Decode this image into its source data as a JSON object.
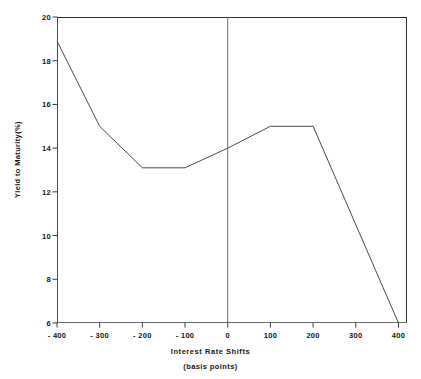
{
  "chart_data": {
    "type": "line",
    "title": "",
    "xlabel": "Interest Rate Shifts",
    "xlabel_line2": "(basis points)",
    "ylabel": "Yield to Maturity(%)",
    "xlim": [
      -400,
      420
    ],
    "ylim": [
      6,
      20
    ],
    "grid": false,
    "legend": null,
    "xticks": [
      -400,
      -300,
      -200,
      -100,
      0,
      100,
      200,
      300,
      400
    ],
    "xtick_labels": [
      "- 400",
      "- 300",
      "- 200",
      "- 100",
      "0",
      "100",
      "200",
      "300",
      "400"
    ],
    "yticks": [
      6,
      8,
      10,
      12,
      14,
      16,
      18,
      20
    ],
    "ytick_labels": [
      "6",
      "8",
      "10",
      "12",
      "14",
      "16",
      "18",
      "20"
    ],
    "series": [
      {
        "name": "Yield to Maturity",
        "color": "#4a4a4a",
        "x": [
          -400,
          -300,
          -200,
          -100,
          0,
          100,
          200,
          400
        ],
        "values": [
          18.9,
          15.0,
          13.1,
          13.1,
          14.0,
          15.0,
          15.0,
          6.0
        ]
      }
    ],
    "annotations": [
      {
        "name": "zero-shift-reference-line",
        "type": "vline",
        "x": 0
      }
    ],
    "line_color": "#4a4a4a",
    "axis_color": "#2e2e2e",
    "background_color": "#ffffff"
  }
}
